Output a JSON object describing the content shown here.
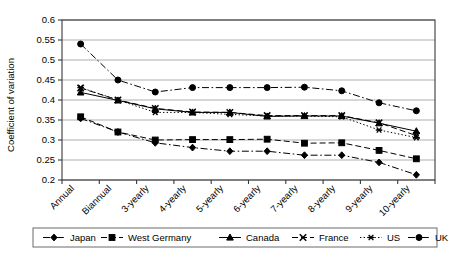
{
  "chart_data": {
    "type": "line",
    "title": "",
    "xlabel": "",
    "ylabel": "Coefficient of variation",
    "ylim": [
      0.2,
      0.6
    ],
    "ytick_labels": [
      "0.6",
      "0.55",
      "0.5",
      "0.45",
      "0.4",
      "0.35",
      "0.3",
      "0.25",
      "0.2"
    ],
    "ytick_values": [
      0.6,
      0.55,
      0.5,
      0.45,
      0.4,
      0.35,
      0.3,
      0.25,
      0.2
    ],
    "grid": true,
    "legend_position": "bottom",
    "categories": [
      "Annual",
      "Biannual",
      "3-yearly",
      "4-yearly",
      "5-yearly",
      "6-yearly",
      "7-yearly",
      "8-yearly",
      "9-yearly",
      "10-yearly"
    ],
    "series": [
      {
        "name": "Japan",
        "marker": "diamond",
        "dash": "dash-dot",
        "values": [
          0.354,
          0.32,
          0.293,
          0.281,
          0.272,
          0.272,
          0.262,
          0.262,
          0.244,
          0.213
        ]
      },
      {
        "name": "West Germany",
        "marker": "square",
        "dash": "dashed",
        "values": [
          0.358,
          0.32,
          0.3,
          0.301,
          0.301,
          0.302,
          0.292,
          0.293,
          0.274,
          0.253
        ]
      },
      {
        "name": "Canada",
        "marker": "triangle",
        "dash": "solid",
        "values": [
          0.419,
          0.399,
          0.378,
          0.369,
          0.369,
          0.359,
          0.36,
          0.36,
          0.342,
          0.322
        ]
      },
      {
        "name": "France",
        "marker": "x",
        "dash": "dashed",
        "values": [
          0.43,
          0.4,
          0.379,
          0.37,
          0.369,
          0.361,
          0.361,
          0.361,
          0.343,
          0.311
        ]
      },
      {
        "name": "US",
        "marker": "asterisk",
        "dash": "dotted",
        "values": [
          0.431,
          0.4,
          0.369,
          0.369,
          0.364,
          0.36,
          0.36,
          0.358,
          0.325,
          0.306
        ]
      },
      {
        "name": "UK",
        "marker": "circle",
        "dash": "dash-dot",
        "values": [
          0.54,
          0.45,
          0.42,
          0.431,
          0.431,
          0.431,
          0.432,
          0.423,
          0.393,
          0.373
        ]
      }
    ]
  },
  "legend": {
    "items": [
      {
        "label": "Japan"
      },
      {
        "label": "West Germany"
      },
      {
        "label": "Canada"
      },
      {
        "label": "France"
      },
      {
        "label": "US"
      },
      {
        "label": "UK"
      }
    ]
  },
  "colors": {
    "series": "#000000",
    "grid": "#9a9a9a",
    "axis": "#3a3a3a",
    "background": "#ffffff"
  }
}
